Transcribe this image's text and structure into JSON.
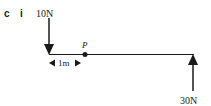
{
  "question": {
    "part_letter": "c",
    "sub_part": "i"
  },
  "diagram": {
    "force_left": {
      "label": "10N",
      "direction": "down"
    },
    "force_right": {
      "label": "30N",
      "direction": "up"
    },
    "point": {
      "label": "P"
    },
    "distance": {
      "label": "1m"
    },
    "stroke_color": "#1a1a1a"
  }
}
